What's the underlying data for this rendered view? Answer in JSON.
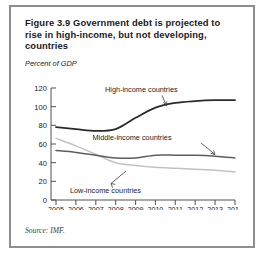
{
  "figure": {
    "title": "Figure 3.9  Government debt is projected to rise in high-income, but not developing, countries",
    "source_note": "Source: IMF."
  },
  "chart_data": {
    "type": "line",
    "title": "Figure 3.9  Government debt is projected to rise in high-income, but not developing, countries",
    "xlabel": "",
    "ylabel": "Percent of GDP",
    "axis_label_top": "Percent of GDP",
    "categories": [
      "2005",
      "2006",
      "2007",
      "2008",
      "2009",
      "2010",
      "2011",
      "2012",
      "2013",
      "2014"
    ],
    "x": [
      2005,
      2006,
      2007,
      2008,
      2009,
      2010,
      2011,
      2012,
      2013,
      2014
    ],
    "xlim": [
      2005,
      2014
    ],
    "ylim": [
      0,
      120
    ],
    "yticks": [
      0,
      20,
      40,
      60,
      80,
      100,
      120
    ],
    "grid": false,
    "legend_position": "inline-annotations",
    "series": [
      {
        "name": "High-income countries",
        "color": "#2a2a2a",
        "values": [
          78,
          76,
          74,
          76,
          88,
          99,
          104,
          106,
          107,
          107
        ]
      },
      {
        "name": "Middle-income countries",
        "color": "#5d5d5d",
        "values": [
          53,
          51,
          48,
          45,
          45,
          48,
          48,
          48,
          47,
          45
        ]
      },
      {
        "name": "Low-income countries",
        "color": "#c2c2c2",
        "values": [
          66,
          58,
          49,
          40,
          37,
          35,
          34,
          33,
          32,
          30
        ]
      }
    ],
    "annotations": [
      {
        "text": "High-income countries",
        "series": "High-income countries"
      },
      {
        "text": "Middle-income countries",
        "series": "Middle-income countries"
      },
      {
        "text": "Low-income countries",
        "series": "Low-income countries"
      }
    ]
  }
}
